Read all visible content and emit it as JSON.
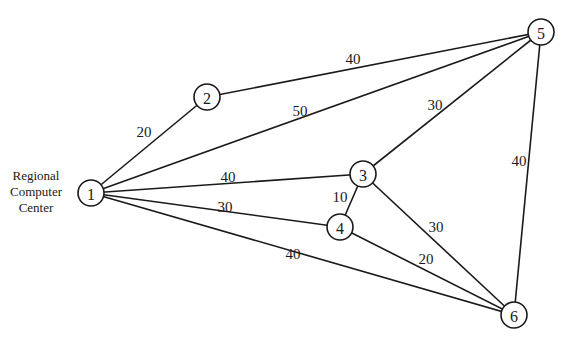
{
  "caption": {
    "line1": "Regional",
    "line2": "Computer",
    "line3": "Center"
  },
  "nodes": [
    {
      "id": "1",
      "x": 91,
      "y": 193
    },
    {
      "id": "2",
      "x": 207,
      "y": 97
    },
    {
      "id": "3",
      "x": 363,
      "y": 174
    },
    {
      "id": "4",
      "x": 340,
      "y": 227
    },
    {
      "id": "5",
      "x": 541,
      "y": 32
    },
    {
      "id": "6",
      "x": 514,
      "y": 315
    }
  ],
  "edges": [
    {
      "from": "1",
      "to": "2",
      "weight": "20",
      "lx": 144,
      "ly": 132
    },
    {
      "from": "2",
      "to": "5",
      "weight": "40",
      "lx": 353,
      "ly": 59
    },
    {
      "from": "1",
      "to": "5",
      "weight": "50",
      "lx": 300,
      "ly": 111
    },
    {
      "from": "3",
      "to": "5",
      "weight": "30",
      "lx": 435,
      "ly": 105
    },
    {
      "from": "5",
      "to": "6",
      "weight": "40",
      "lx": 519,
      "ly": 161
    },
    {
      "from": "1",
      "to": "3",
      "weight": "40",
      "lx": 228,
      "ly": 177
    },
    {
      "from": "3",
      "to": "4",
      "weight": "10",
      "lx": 340,
      "ly": 197
    },
    {
      "from": "1",
      "to": "4",
      "weight": "30",
      "lx": 225,
      "ly": 207
    },
    {
      "from": "3",
      "to": "6",
      "weight": "30",
      "lx": 436,
      "ly": 227
    },
    {
      "from": "4",
      "to": "6",
      "weight": "20",
      "lx": 426,
      "ly": 259
    },
    {
      "from": "1",
      "to": "6",
      "weight": "40",
      "lx": 293,
      "ly": 254
    }
  ],
  "style": {
    "node_radius": 13,
    "stroke_color": "#1a1a1a"
  }
}
